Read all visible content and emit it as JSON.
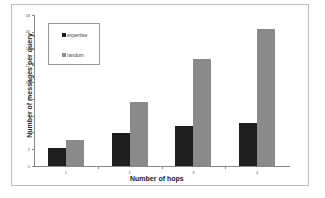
{
  "chart_data": {
    "type": "bar",
    "title": "",
    "xlabel": "Number of hops",
    "ylabel": "Number of messages per query",
    "categories": [
      "1",
      "2",
      "3",
      "4"
    ],
    "series": [
      {
        "name": "expertise",
        "color": "#1e1e1e",
        "values": [
          2.2,
          3.9,
          4.8,
          5.1
        ]
      },
      {
        "name": "random",
        "color": "#8a8a8a",
        "values": [
          3.1,
          7.6,
          12.7,
          16.3
        ]
      }
    ],
    "ylim": [
      0,
      18
    ],
    "yticks": [
      "0",
      "2",
      "4",
      "6",
      "8",
      "10",
      "12",
      "14",
      "16",
      "18"
    ],
    "grid": false,
    "legend_position": "upper-left"
  }
}
